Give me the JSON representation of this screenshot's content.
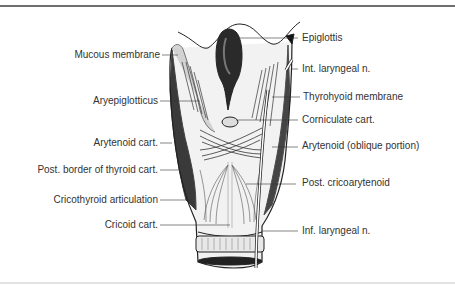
{
  "figure": {
    "labels_left": [
      {
        "text": "Mucous membrane",
        "y": 55
      },
      {
        "text": "Aryepiglotticus",
        "y": 100
      },
      {
        "text": "Arytenoid cart.",
        "y": 142
      },
      {
        "text": "Post. border of thyroid cart.",
        "y": 170
      },
      {
        "text": "Cricothyroid articulation",
        "y": 200
      },
      {
        "text": "Cricoid cart.",
        "y": 224
      }
    ],
    "labels_right": [
      {
        "text": "Epiglottis",
        "y": 38
      },
      {
        "text": "Int. laryngeal n.",
        "y": 69
      },
      {
        "text": "Thyrohyoid membrane",
        "y": 97
      },
      {
        "text": "Corniculate cart.",
        "y": 120
      },
      {
        "text": "Arytenoid  (oblique portion)",
        "y": 146
      },
      {
        "text": "Post. cricoarytenoid",
        "y": 183
      },
      {
        "text": "Inf. laryngeal n.",
        "y": 231
      }
    ]
  }
}
